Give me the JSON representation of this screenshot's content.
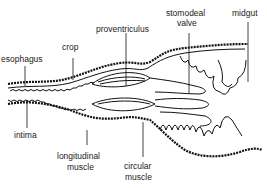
{
  "diagram": {
    "type": "anatomical cross-section of insect foregut",
    "labels": {
      "esophagus": "esophagus",
      "crop": "crop",
      "proventriculus": "proventriculus",
      "stomodeal_valve_line1": "stomodeal",
      "stomodeal_valve_line2": "valve",
      "midgut": "midgut",
      "intima": "intima",
      "longitudinal_muscle_line1": "longitudinal",
      "longitudinal_muscle_line2": "muscle",
      "circular_muscle_line1": "circular",
      "circular_muscle_line2": "muscle"
    }
  }
}
